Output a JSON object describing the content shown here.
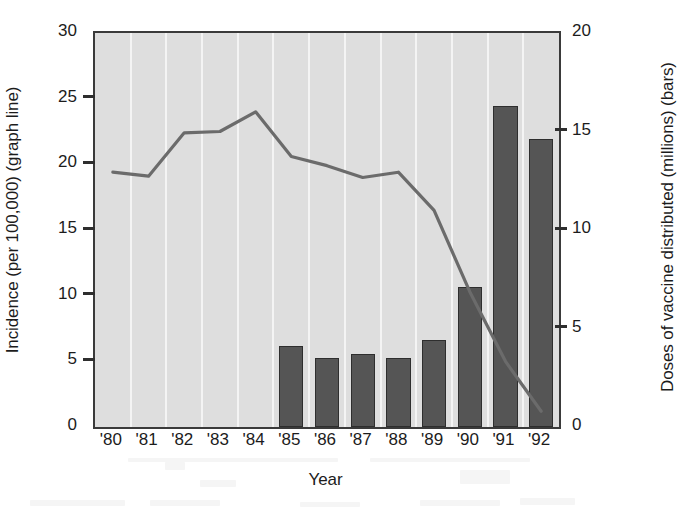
{
  "chart_data": {
    "type": "bar",
    "title": "",
    "subtitle": "",
    "xlabel": "Year",
    "ylabel": "Incidence (per 100,000) (graph line)",
    "y2label": "Doses of vaccine distributed (millions) (bars)",
    "categories": [
      "'80",
      "'81",
      "'82",
      "'83",
      "'84",
      "'85",
      "'86",
      "'87",
      "'88",
      "'89",
      "'90",
      "'91",
      "'92"
    ],
    "ylim": [
      0,
      30
    ],
    "y2lim": [
      0,
      20
    ],
    "yticks": [
      0,
      5,
      10,
      15,
      20,
      25,
      30
    ],
    "y2ticks": [
      0,
      5,
      10,
      15,
      20
    ],
    "ytick_labels": [
      "0",
      "5",
      "10",
      "15",
      "20",
      "25",
      "30"
    ],
    "y2tick_labels": [
      "0",
      "5",
      "10",
      "15",
      "20"
    ],
    "grid": "vertical-only",
    "legend": "none",
    "series": [
      {
        "name": "Doses of vaccine distributed (millions)",
        "type": "bar",
        "axis": "right",
        "color": "#555555",
        "values": [
          null,
          null,
          null,
          null,
          null,
          4.1,
          3.5,
          3.7,
          3.5,
          4.4,
          7.1,
          16.3,
          14.6
        ]
      },
      {
        "name": "Incidence (per 100,000)",
        "type": "line",
        "axis": "left",
        "color": "#6b6b6b",
        "values": [
          19.4,
          19.1,
          22.4,
          22.5,
          24.0,
          20.6,
          19.9,
          19.0,
          19.4,
          16.5,
          10.3,
          5.0,
          1.2
        ]
      }
    ]
  },
  "figure": {
    "plot_background_color": "#dedede",
    "gridline_color": "#f4f4f4",
    "axis_color": "#3a3a3a",
    "bar_color": "#555555",
    "line_color": "#6b6b6b",
    "page_background_color": "#ffffff"
  }
}
